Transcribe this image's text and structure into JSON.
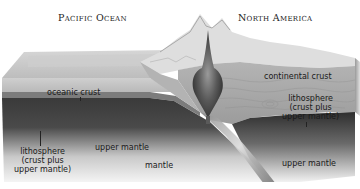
{
  "diagram": {
    "type": "subduction-zone-cross-section",
    "regions": {
      "left_title": "Pacific Ocean",
      "right_title": "North America"
    },
    "labels": {
      "oceanic_crust": "oceanic crust",
      "continental_crust": "continental crust",
      "lithosphere_left": [
        "lithosphere",
        "(crust plus",
        "upper mantle)"
      ],
      "lithosphere_right": [
        "lithosphere",
        "(crust plus",
        "upper mantle)"
      ],
      "upper_mantle_left": "upper mantle",
      "upper_mantle_right": "upper mantle",
      "mantle": "mantle"
    },
    "colors": {
      "ocean_surface": "#c8c8c8",
      "oceanic_crust_band": "#7a7a7a",
      "lithosphere_dark": "#3e3e3e",
      "mantle_light": "#f2f2f2",
      "continental_crust": "#a8a8a8",
      "magma_plume": "#555555"
    }
  }
}
